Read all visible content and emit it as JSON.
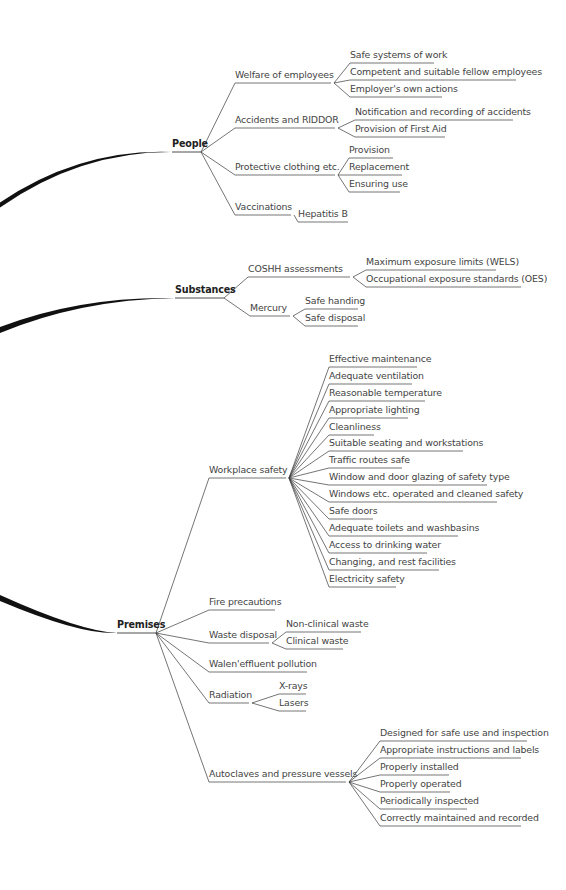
{
  "diagram": {
    "branches": [
      {
        "label": "People",
        "x": 172,
        "y": 152,
        "w": 29,
        "children": [
          {
            "label": "Welfare of employees",
            "x": 235,
            "y": 83,
            "w": 96,
            "children": [
              {
                "label": "Safe systems of work",
                "x": 350,
                "y": 63,
                "w": 84
              },
              {
                "label": "Competent and suitable fellow employees",
                "x": 350,
                "y": 80,
                "w": 166
              },
              {
                "label": "Employer's own actions",
                "x": 350,
                "y": 97,
                "w": 92
              }
            ]
          },
          {
            "label": "Accidents and RIDDOR",
            "x": 235,
            "y": 128,
            "w": 100,
            "children": [
              {
                "label": "Notification and recording of accidents",
                "x": 355,
                "y": 120,
                "w": 158
              },
              {
                "label": "Provision of First Aid",
                "x": 355,
                "y": 137,
                "w": 90
              }
            ]
          },
          {
            "label": "Protective clothing etc.",
            "x": 235,
            "y": 175,
            "w": 100,
            "children": [
              {
                "label": "Provision",
                "x": 349,
                "y": 158,
                "w": 44
              },
              {
                "label": "Replacement",
                "x": 349,
                "y": 175,
                "w": 53
              },
              {
                "label": "Ensuring use",
                "x": 349,
                "y": 192,
                "w": 51
              }
            ]
          },
          {
            "label": "Vaccinations",
            "x": 235,
            "y": 215,
            "w": 56,
            "children": [
              {
                "label": "Hepatitis B",
                "x": 298,
                "y": 222,
                "w": 50
              }
            ]
          }
        ]
      },
      {
        "label": "Substances",
        "x": 175,
        "y": 298,
        "w": 49,
        "children": [
          {
            "label": "COSHH assessments",
            "x": 248,
            "y": 277,
            "w": 102,
            "children": [
              {
                "label": "Maximum exposure limits (WELS)",
                "x": 366,
                "y": 270,
                "w": 130
              },
              {
                "label": "Occupational exposure standards (OES)",
                "x": 366,
                "y": 287,
                "w": 155
              }
            ]
          },
          {
            "label": "Mercury",
            "x": 250,
            "y": 316,
            "w": 40,
            "children": [
              {
                "label": "Safe handing",
                "x": 305,
                "y": 309,
                "w": 53
              },
              {
                "label": "Safe disposal",
                "x": 305,
                "y": 326,
                "w": 53
              }
            ]
          }
        ]
      },
      {
        "label": "Premises",
        "x": 117,
        "y": 633,
        "w": 39,
        "children": [
          {
            "label": "Workplace safety",
            "x": 209,
            "y": 478,
            "w": 77,
            "children": [
              {
                "label": "Effective maintenance",
                "x": 329,
                "y": 367,
                "w": 88
              },
              {
                "label": "Adequate ventilation",
                "x": 329,
                "y": 384,
                "w": 83
              },
              {
                "label": "Reasonable temperature",
                "x": 329,
                "y": 401,
                "w": 96
              },
              {
                "label": "Appropriate lighting",
                "x": 329,
                "y": 418,
                "w": 79
              },
              {
                "label": "Cleanliness",
                "x": 329,
                "y": 435,
                "w": 45
              },
              {
                "label": "Suitable seating and workstations",
                "x": 329,
                "y": 451,
                "w": 134
              },
              {
                "label": "Traffic routes safe",
                "x": 329,
                "y": 468,
                "w": 73
              },
              {
                "label": "Window and door glazing of safety type",
                "x": 329,
                "y": 485,
                "w": 158
              },
              {
                "label": "Windows etc. operated and cleaned safety",
                "x": 329,
                "y": 502,
                "w": 168
              },
              {
                "label": "Safe doors",
                "x": 329,
                "y": 519,
                "w": 44
              },
              {
                "label": "Adequate toilets and washbasins",
                "x": 329,
                "y": 536,
                "w": 129
              },
              {
                "label": "Access to drinking water",
                "x": 329,
                "y": 553,
                "w": 98
              },
              {
                "label": "Changing, and rest facilities",
                "x": 329,
                "y": 570,
                "w": 110
              },
              {
                "label": "Electricity safety",
                "x": 329,
                "y": 587,
                "w": 67
              }
            ]
          },
          {
            "label": "Fire precautions",
            "x": 209,
            "y": 610,
            "w": 66
          },
          {
            "label": "Waste disposal",
            "x": 209,
            "y": 643,
            "w": 60,
            "children": [
              {
                "label": "Non-clinical waste",
                "x": 286,
                "y": 632,
                "w": 75
              },
              {
                "label": "Clinical waste",
                "x": 286,
                "y": 649,
                "w": 57
              }
            ]
          },
          {
            "label": "Walen'effluent pollution",
            "x": 209,
            "y": 672,
            "w": 98
          },
          {
            "label": "Radiation",
            "x": 209,
            "y": 703,
            "w": 40,
            "children": [
              {
                "label": "X-rays",
                "x": 279,
                "y": 694,
                "w": 27
              },
              {
                "label": "Lasers",
                "x": 279,
                "y": 711,
                "w": 27
              }
            ]
          },
          {
            "label": "Autoclaves and pressure vessels",
            "x": 209,
            "y": 782,
            "w": 137,
            "children": [
              {
                "label": "Designed for safe use and inspection",
                "x": 380,
                "y": 741,
                "w": 147
              },
              {
                "label": "Appropriate instructions and labels",
                "x": 380,
                "y": 758,
                "w": 141
              },
              {
                "label": "Properly installed",
                "x": 380,
                "y": 775,
                "w": 69
              },
              {
                "label": "Properly operated",
                "x": 380,
                "y": 792,
                "w": 70
              },
              {
                "label": "Periodically inspected",
                "x": 380,
                "y": 809,
                "w": 87
              },
              {
                "label": "Correctly maintained and recorded",
                "x": 380,
                "y": 826,
                "w": 141
              }
            ]
          }
        ]
      }
    ],
    "trunks": [
      {
        "from": [
          0,
          205
        ],
        "ctrl": [
          80,
          150
        ],
        "to": [
          172,
          152
        ],
        "thick": 5
      },
      {
        "from": [
          0,
          330
        ],
        "ctrl": [
          80,
          298
        ],
        "to": [
          175,
          298
        ],
        "thick": 6
      },
      {
        "from": [
          0,
          598
        ],
        "ctrl": [
          80,
          633
        ],
        "to": [
          117,
          633
        ],
        "thick": 6
      }
    ],
    "colors": {
      "line": "#3a3a3a",
      "trunk": "#111111",
      "text": "#444444"
    }
  }
}
